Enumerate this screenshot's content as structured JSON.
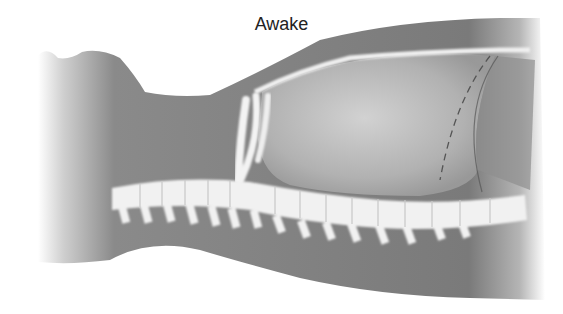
{
  "figure": {
    "title": "Awake",
    "colors": {
      "body_fill": "#7d7d7d",
      "body_dark": "#5e5e5e",
      "chest_cavity": "#bdbdbd",
      "bone": "#f2f2f2",
      "diaphragm_line": "#555555",
      "background": "#ffffff"
    }
  }
}
